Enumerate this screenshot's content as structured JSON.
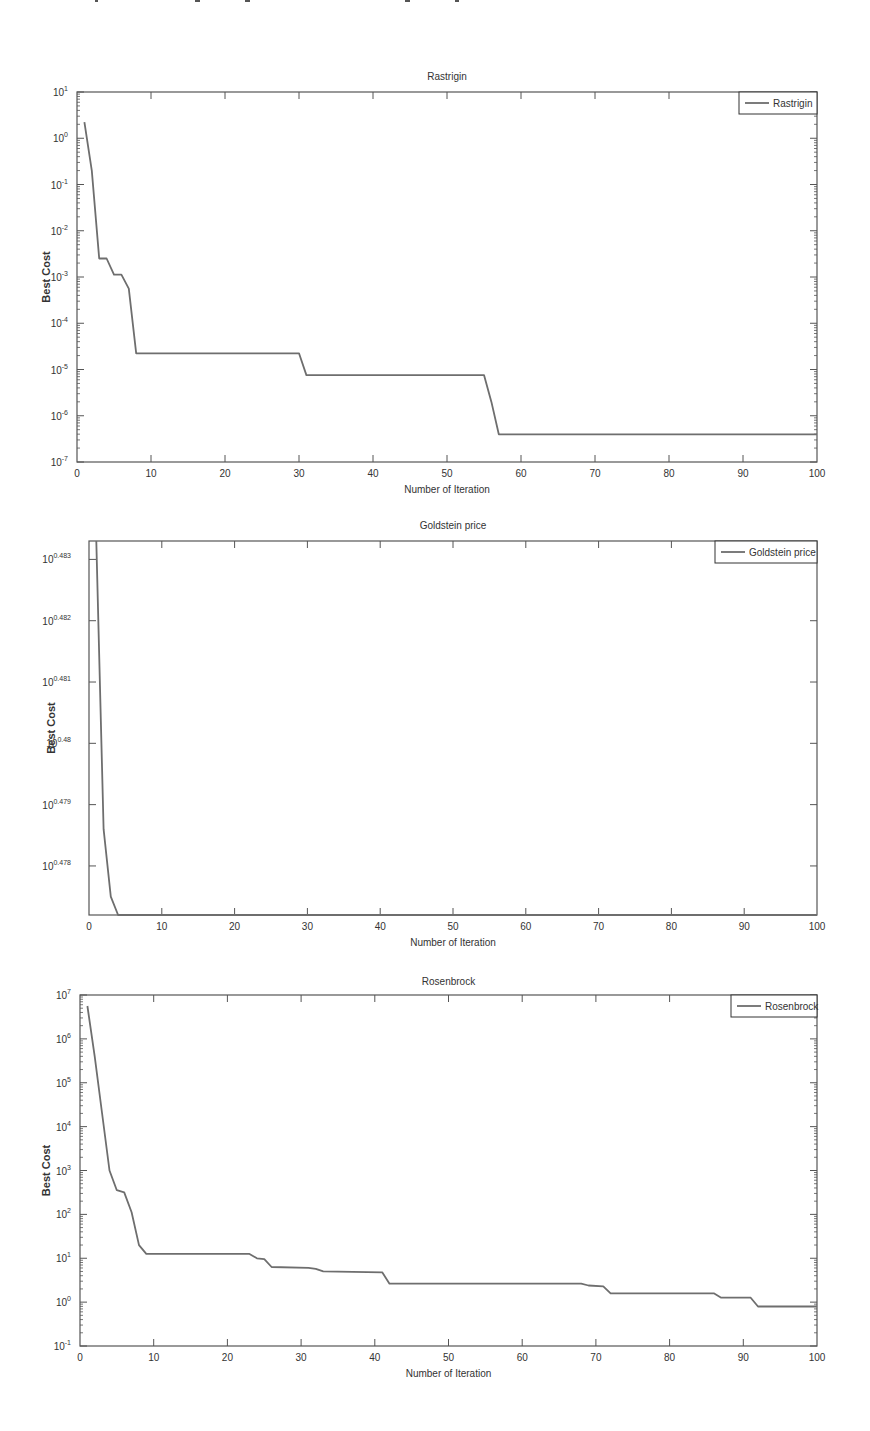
{
  "page": {
    "top_fragment_text": ""
  },
  "chart_data": [
    {
      "type": "line",
      "title": "Rastrigin",
      "xlabel": "Number of Iteration",
      "ylabel": "Best Cost",
      "yscale": "log",
      "xlim": [
        0,
        100
      ],
      "ylim_exponents": [
        -7,
        1
      ],
      "x_ticks": [
        "0",
        "10",
        "20",
        "30",
        "40",
        "50",
        "60",
        "70",
        "80",
        "90",
        "100"
      ],
      "y_ticks": [
        "10^-7",
        "10^-6",
        "10^-5",
        "10^-4",
        "10^-3",
        "10^-2",
        "10^-1",
        "10^0",
        "10^1"
      ],
      "legend": [
        "Rastrigin"
      ],
      "legend_position": "upper right",
      "grid": false,
      "series": [
        {
          "name": "Rastrigin",
          "x": [
            1,
            2,
            3,
            4,
            5,
            6,
            7,
            8,
            30,
            31,
            55,
            56,
            57,
            100
          ],
          "log10_y": [
            0.35,
            -0.7,
            -2.6,
            -2.6,
            -2.95,
            -2.95,
            -3.25,
            -4.65,
            -4.65,
            -5.12,
            -5.12,
            -5.7,
            -6.4,
            -6.4
          ]
        }
      ]
    },
    {
      "type": "line",
      "title": "Goldstein price",
      "xlabel": "Number of Iteration",
      "ylabel": "Best Cost",
      "yscale": "log",
      "xlim": [
        0,
        100
      ],
      "ylim_exponents": [
        0.4772,
        0.4833
      ],
      "x_ticks": [
        "0",
        "10",
        "20",
        "30",
        "40",
        "50",
        "60",
        "70",
        "80",
        "90",
        "100"
      ],
      "y_ticks": [
        "10^0.478",
        "10^0.479",
        "10^0.48",
        "10^0.481",
        "10^0.482",
        "10^0.483"
      ],
      "legend": [
        "Goldstein price"
      ],
      "legend_position": "upper right",
      "grid": false,
      "series": [
        {
          "name": "Goldstein price",
          "x": [
            1,
            2,
            3,
            4,
            100
          ],
          "log10_y": [
            0.4833,
            0.4786,
            0.4775,
            0.4772,
            0.4772
          ]
        }
      ]
    },
    {
      "type": "line",
      "title": "Rosenbrock",
      "xlabel": "Number of Iteration",
      "ylabel": "Best Cost",
      "yscale": "log",
      "xlim": [
        0,
        100
      ],
      "ylim_exponents": [
        -1,
        7
      ],
      "x_ticks": [
        "0",
        "10",
        "20",
        "30",
        "40",
        "50",
        "60",
        "70",
        "80",
        "90",
        "100"
      ],
      "y_ticks": [
        "10^-1",
        "10^0",
        "10^1",
        "10^2",
        "10^3",
        "10^4",
        "10^5",
        "10^6",
        "10^7"
      ],
      "legend": [
        "Rosenbrock"
      ],
      "legend_position": "upper right",
      "grid": false,
      "series": [
        {
          "name": "Rosenbrock",
          "x": [
            1,
            2,
            3,
            4,
            5,
            6,
            7,
            8,
            9,
            23,
            24,
            25,
            26,
            31,
            32,
            33,
            41,
            42,
            68,
            69,
            71,
            72,
            86,
            87,
            91,
            92,
            100
          ],
          "log10_y": [
            6.75,
            5.6,
            4.3,
            3.0,
            2.55,
            2.5,
            2.05,
            1.3,
            1.1,
            1.1,
            1.0,
            0.98,
            0.8,
            0.78,
            0.76,
            0.7,
            0.68,
            0.42,
            0.42,
            0.38,
            0.36,
            0.2,
            0.2,
            0.1,
            0.1,
            -0.1,
            -0.1
          ]
        }
      ]
    }
  ],
  "charts": [
    {
      "title": "Rastrigin",
      "legend_label": "Rastrigin",
      "xlabel": "Number of Iteration",
      "ylabel": "Best Cost"
    },
    {
      "title": "Goldstein price",
      "legend_label": "Goldstein price",
      "xlabel": "Number of Iteration",
      "ylabel": "Best Cost"
    },
    {
      "title": "Rosenbrock",
      "legend_label": "Rosenbrock",
      "xlabel": "Number of Iteration",
      "ylabel": "Best Cost"
    }
  ],
  "colors": {
    "line": "#6e6e6e",
    "axis": "#555555",
    "text": "#333333",
    "background": "#ffffff"
  }
}
